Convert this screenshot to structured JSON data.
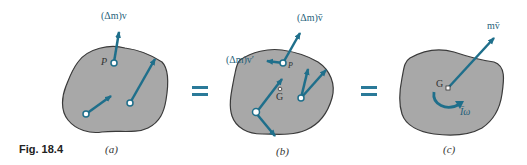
{
  "figure": {
    "caption": "Fig. 18.4",
    "panels": [
      {
        "id": "a",
        "label": "(a)",
        "point_label": "P",
        "vector_label": "(Δm)v"
      },
      {
        "id": "b",
        "label": "(b)",
        "point_label": "P",
        "center_label": "G",
        "vector_label_1": "(Δm)v̄",
        "vector_label_2": "(Δm)v′"
      },
      {
        "id": "c",
        "label": "(c)",
        "center_label": "G",
        "vector_label": "mv̄",
        "moment_label": "Īω"
      }
    ],
    "equals": [
      "=",
      "="
    ],
    "colors": {
      "body_fill": "#a8a8a8",
      "body_stroke": "#3a3a3a",
      "vector": "#1f6f8b",
      "equals": "#2a7a99"
    }
  }
}
